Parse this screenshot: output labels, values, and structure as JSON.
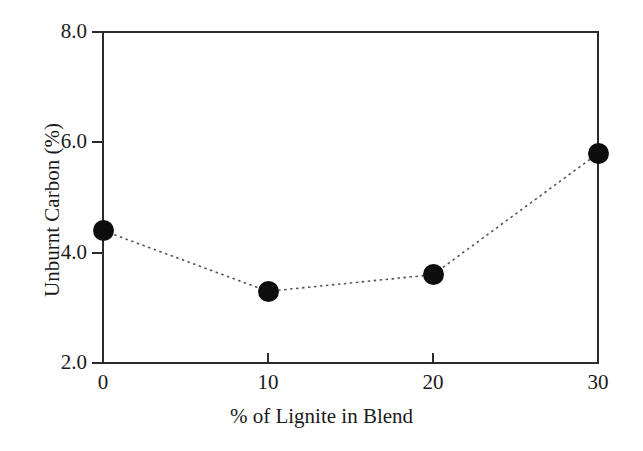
{
  "chart_data": {
    "type": "line",
    "title": "",
    "xlabel": "% of Lignite in Blend",
    "ylabel": "Unburnt Carbon (%)",
    "x": [
      0,
      10,
      20,
      30
    ],
    "values": [
      4.4,
      3.3,
      3.6,
      5.8
    ],
    "series": [
      {
        "name": "Unburnt Carbon",
        "values": [
          4.4,
          3.3,
          3.6,
          5.8
        ]
      }
    ],
    "xlim": [
      0,
      30
    ],
    "ylim": [
      2.0,
      8.0
    ],
    "xticks": [
      "0",
      "10",
      "20",
      "30"
    ],
    "yticks": [
      "8.0",
      "6.0",
      "4.0",
      "2.0"
    ],
    "ytick_values": [
      8.0,
      6.0,
      4.0,
      2.0
    ],
    "xtick_values": [
      0,
      10,
      20,
      30
    ],
    "grid": false,
    "legend": null,
    "marker": "filled-circle",
    "line_style": "dotted",
    "colors": {
      "marker": "#0d0d0d",
      "line": "#555555",
      "axis": "#2b2b2b",
      "background": "#ffffff",
      "text": "#1a1a1a"
    }
  },
  "axis": {
    "y_tick_labels": [
      "8.0",
      "6.0",
      "4.0",
      "2.0"
    ],
    "x_tick_labels": [
      "0",
      "10",
      "20",
      "30"
    ],
    "x_title": "% of Lignite in Blend",
    "y_title": "Unburnt Carbon (%)"
  }
}
